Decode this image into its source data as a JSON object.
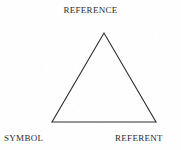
{
  "figure": {
    "name": "semiotic-triangle",
    "background_color": "#fefefe",
    "line_color": "#2f2f2f",
    "text_color": "#2b2b2b",
    "line_width": 1.1,
    "fill": "none"
  },
  "labels": {
    "apex": "Reference",
    "bottom_left": "Symbol",
    "bottom_right": "Referent"
  },
  "geometry": {
    "apex": {
      "x": 104,
      "y": 33
    },
    "bottom_left": {
      "x": 52,
      "y": 122
    },
    "bottom_right": {
      "x": 156,
      "y": 122
    },
    "points": "104,33 52,122 156,122"
  }
}
